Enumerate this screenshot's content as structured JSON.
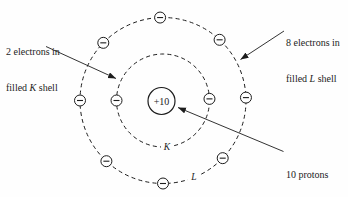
{
  "colors": {
    "ink": "#1c1c1c",
    "paper": "#fefefe"
  },
  "annotations": {
    "k_label": {
      "line1": "2 electrons in",
      "line2_prefix": "filled ",
      "shell_letter": "K",
      "line2_suffix": " shell"
    },
    "l_label": {
      "line1": "8 electrons in",
      "line2_prefix": "filled ",
      "shell_letter": "L",
      "line2_suffix": " shell"
    },
    "nucleus_label": {
      "line1": "10 protons",
      "line2": "in nucleus"
    }
  },
  "nucleus": {
    "charge_label": "+10",
    "proton_count": 10
  },
  "shells": [
    {
      "letter": "K",
      "electron_count": 2
    },
    {
      "letter": "L",
      "electron_count": 8
    }
  ],
  "electron_symbol": "−"
}
